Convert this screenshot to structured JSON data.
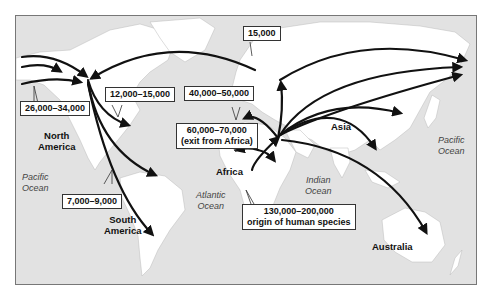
{
  "map": {
    "colors": {
      "ocean": "#e2e2e2",
      "land": "#ffffff",
      "arrow": "#111111",
      "frame": "#777777"
    },
    "regions": [
      {
        "id": "north-america",
        "lines": [
          "North",
          "America"
        ]
      },
      {
        "id": "south-america",
        "lines": [
          "South",
          "America"
        ]
      },
      {
        "id": "africa",
        "lines": [
          "Africa"
        ]
      },
      {
        "id": "asia",
        "lines": [
          "Asia"
        ]
      },
      {
        "id": "australia",
        "lines": [
          "Australia"
        ]
      }
    ],
    "oceans": [
      {
        "id": "pacific-west",
        "lines": [
          "Pacific",
          "Ocean"
        ]
      },
      {
        "id": "atlantic",
        "lines": [
          "Atlantic",
          "Ocean"
        ]
      },
      {
        "id": "indian",
        "lines": [
          "Indian",
          "Ocean"
        ]
      },
      {
        "id": "pacific-east",
        "lines": [
          "Pacific",
          "Ocean"
        ]
      }
    ],
    "migration_labels": [
      {
        "id": "beringia",
        "lines": [
          "26,000–34,000"
        ]
      },
      {
        "id": "north-america-spread",
        "lines": [
          "12,000–15,000"
        ]
      },
      {
        "id": "south-america-spread",
        "lines": [
          "7,000–9,000"
        ]
      },
      {
        "id": "atlantic-crossing",
        "lines": [
          "15,000"
        ]
      },
      {
        "id": "europe",
        "lines": [
          "40,000–50,000"
        ]
      },
      {
        "id": "exit-africa",
        "lines": [
          "60,000–70,000",
          "(exit from Africa)"
        ]
      },
      {
        "id": "origin",
        "lines": [
          "130,000–200,000",
          "origin of human species"
        ]
      }
    ]
  }
}
